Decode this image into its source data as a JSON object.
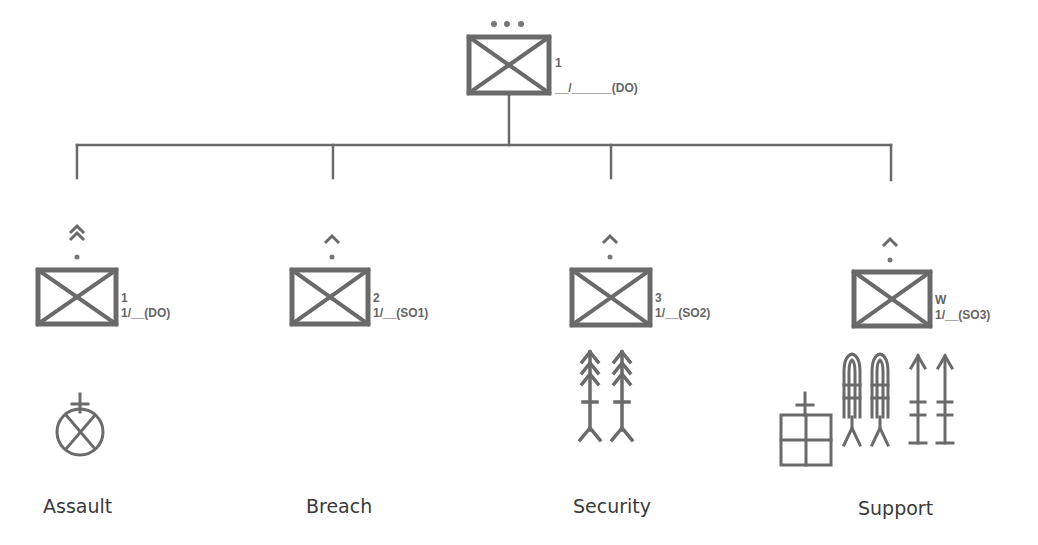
{
  "colors": {
    "stroke": "#6a6a6a",
    "text": "#666666",
    "caption": "#3a3a3a",
    "background": "#ffffff"
  },
  "headquarters": {
    "echelon": "battalion",
    "echelon_marker": "•••",
    "unit_id": "1",
    "designation": "__/______(DO)"
  },
  "units": [
    {
      "caption": "Assault",
      "echelon": "company",
      "echelon_marker": "double-chevron",
      "unit_id": "1",
      "designation": "1/__(DO)",
      "task_symbols": [
        "attack-by-fire-position-icon"
      ]
    },
    {
      "caption": "Breach",
      "echelon": "platoon",
      "echelon_marker": "chevron",
      "unit_id": "2",
      "designation": "1/__(SO1)",
      "task_symbols": []
    },
    {
      "caption": "Security",
      "echelon": "platoon",
      "echelon_marker": "chevron",
      "unit_id": "3",
      "designation": "1/__(SO2)",
      "task_symbols": [
        "double-arrow-icon",
        "double-arrow-icon"
      ]
    },
    {
      "caption": "Support",
      "echelon": "platoon",
      "echelon_marker": "chevron",
      "unit_id": "W",
      "designation": "1/__(SO3)",
      "task_symbols": [
        "medical-station-icon",
        "rocket-launcher-icon",
        "rocket-launcher-icon",
        "missile-icon",
        "missile-icon"
      ]
    }
  ]
}
